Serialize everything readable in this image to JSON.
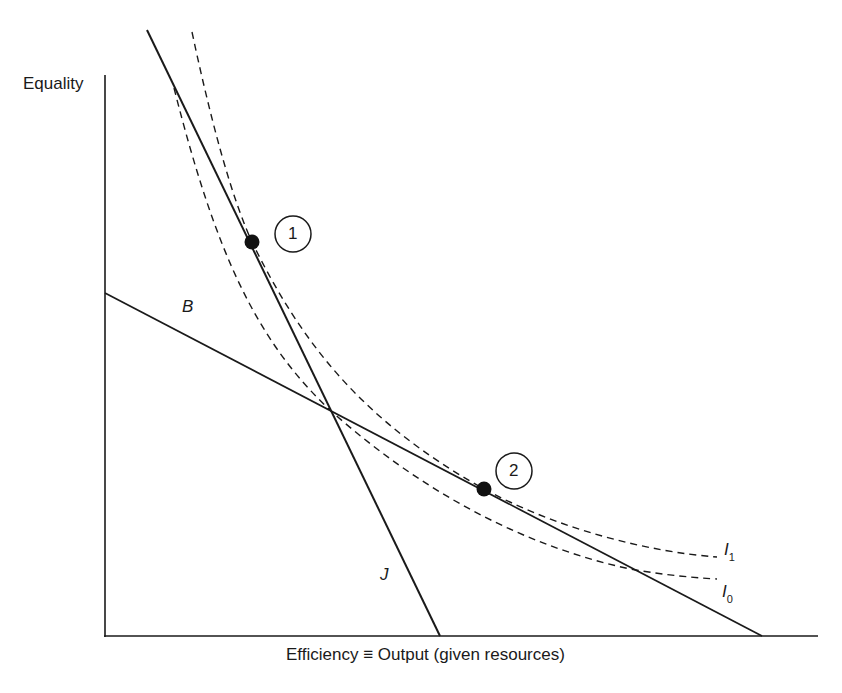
{
  "axes": {
    "y_label": "Equality",
    "x_label": "Efficiency ≡ Output (given resources)"
  },
  "lines": {
    "B": {
      "label": "B",
      "style": "solid"
    },
    "J": {
      "label": "J",
      "style": "solid"
    }
  },
  "curves": {
    "I1": {
      "label_main": "I",
      "label_sub": "1",
      "style": "dashed"
    },
    "I0": {
      "label_main": "I",
      "label_sub": "0",
      "style": "dashed"
    }
  },
  "points": [
    {
      "id": "point-1",
      "label": "1",
      "description": "Tangency of J with I1"
    },
    {
      "id": "point-2",
      "label": "2",
      "description": "Tangency of B with I1"
    }
  ],
  "colors": {
    "ink": "#1a1a1a",
    "background": "#ffffff"
  }
}
